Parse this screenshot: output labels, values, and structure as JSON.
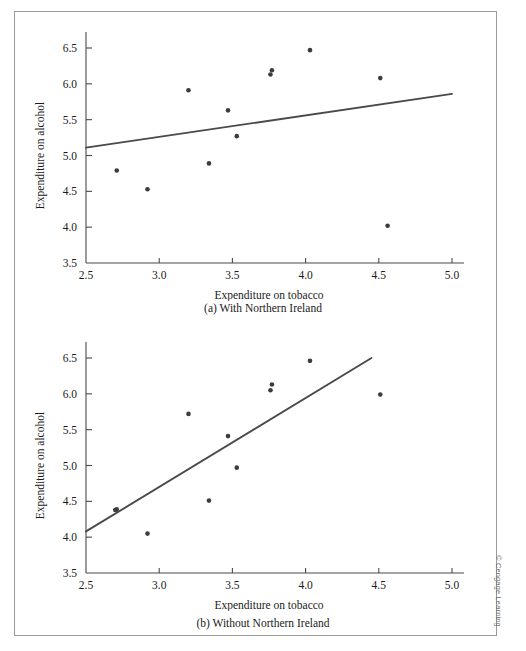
{
  "figure": {
    "credit": "© Cengage Learning",
    "axis_labels": {
      "x": "Expenditure on tobacco",
      "y": "Expenditure on alcohol"
    },
    "captions": {
      "a": "(a) With Northern Ireland",
      "b": "(b) Without Northern Ireland"
    }
  },
  "chart_data": [
    {
      "id": "panel-a",
      "type": "scatter",
      "title": "(a) With Northern Ireland",
      "xlabel": "Expenditure on tobacco",
      "ylabel": "Expenditure on alcohol",
      "xlim": [
        2.5,
        5.0
      ],
      "ylim": [
        3.5,
        6.5
      ],
      "xticks": [
        2.5,
        3.0,
        3.5,
        4.0,
        4.5,
        5.0
      ],
      "xtick_labels": [
        "2.5",
        "3.0",
        "3.5",
        "4.0",
        "4.5",
        "5.0"
      ],
      "yticks": [
        3.5,
        4.0,
        4.5,
        5.0,
        5.5,
        6.0,
        6.5
      ],
      "ytick_labels": [
        "3.5",
        "4.0",
        "4.5",
        "5.0",
        "5.5",
        "6.0",
        "6.5"
      ],
      "grid": false,
      "legend": false,
      "points": [
        {
          "x": 2.71,
          "y": 4.79
        },
        {
          "x": 2.92,
          "y": 4.53
        },
        {
          "x": 3.2,
          "y": 5.91
        },
        {
          "x": 3.34,
          "y": 4.89
        },
        {
          "x": 3.47,
          "y": 5.63
        },
        {
          "x": 3.53,
          "y": 5.27
        },
        {
          "x": 3.76,
          "y": 6.13
        },
        {
          "x": 3.77,
          "y": 6.19
        },
        {
          "x": 4.03,
          "y": 6.47
        },
        {
          "x": 4.51,
          "y": 6.08
        },
        {
          "x": 4.56,
          "y": 4.02
        }
      ],
      "trendline": {
        "x1": 2.5,
        "y1": 5.11,
        "x2": 5.0,
        "y2": 5.86
      }
    },
    {
      "id": "panel-b",
      "type": "scatter",
      "title": "(b) Without Northern Ireland",
      "xlabel": "Expenditure on tobacco",
      "ylabel": "Expenditure on alcohol",
      "xlim": [
        2.5,
        5.0
      ],
      "ylim": [
        3.5,
        6.5
      ],
      "xticks": [
        2.5,
        3.0,
        3.5,
        4.0,
        4.5,
        5.0
      ],
      "xtick_labels": [
        "2.5",
        "3.0",
        "3.5",
        "4.0",
        "4.5",
        "5.0"
      ],
      "yticks": [
        3.5,
        4.0,
        4.5,
        5.0,
        5.5,
        6.0,
        6.5
      ],
      "ytick_labels": [
        "3.5",
        "4.0",
        "4.5",
        "5.0",
        "5.5",
        "6.0",
        "6.5"
      ],
      "grid": false,
      "legend": false,
      "points": [
        {
          "x": 2.7,
          "y": 4.38
        },
        {
          "x": 2.71,
          "y": 4.39
        },
        {
          "x": 2.92,
          "y": 4.05
        },
        {
          "x": 3.2,
          "y": 5.72
        },
        {
          "x": 3.34,
          "y": 4.51
        },
        {
          "x": 3.47,
          "y": 5.41
        },
        {
          "x": 3.53,
          "y": 4.97
        },
        {
          "x": 3.76,
          "y": 6.05
        },
        {
          "x": 3.77,
          "y": 6.13
        },
        {
          "x": 4.03,
          "y": 6.46
        },
        {
          "x": 4.51,
          "y": 5.99
        }
      ],
      "trendline": {
        "x1": 2.5,
        "y1": 4.08,
        "x2": 4.45,
        "y2": 6.5
      }
    }
  ]
}
